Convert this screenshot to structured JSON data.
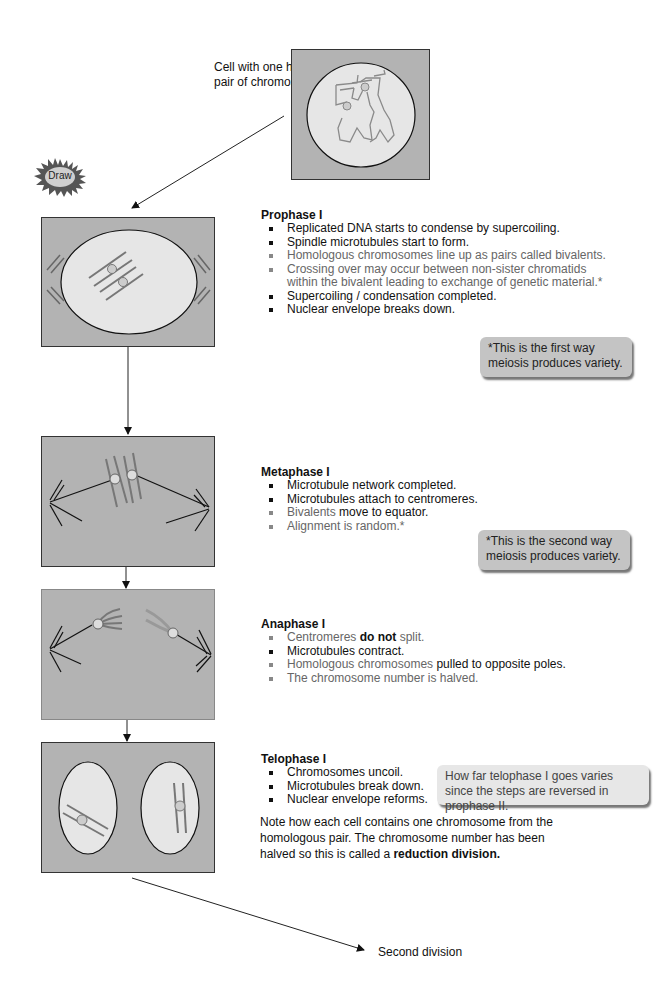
{
  "intro": {
    "label_line1": "Cell with one homologous",
    "label_line2": "pair of chromosomes"
  },
  "draw_badge": {
    "label": "Draw"
  },
  "stages": [
    {
      "title": "Prophase I",
      "bullets": [
        {
          "text": "Replicated DNA starts to condense by supercoiling.",
          "tone": "dark"
        },
        {
          "text": "Spindle microtubules start to form.",
          "tone": "dark"
        },
        {
          "text": "Homologous chromosomes line up as pairs called bivalents.",
          "tone": "grey"
        },
        {
          "text": "Crossing over may occur between non-sister chromatids within the bivalent leading to exchange of genetic material.*",
          "tone": "grey"
        },
        {
          "text": "Supercoiling / condensation completed.",
          "tone": "dark"
        },
        {
          "text": "Nuclear envelope breaks down.",
          "tone": "dark"
        }
      ],
      "callout": "*This is the first way meiosis produces variety."
    },
    {
      "title": "Metaphase I",
      "bullets": [
        {
          "text": "Microtubule network completed.",
          "tone": "dark"
        },
        {
          "text": "Microtubules attach to centromeres.",
          "tone": "dark"
        },
        {
          "parts": [
            "Bivalents",
            " move to equator."
          ],
          "tone": "mixed"
        },
        {
          "text": "Alignment is random.*",
          "tone": "grey"
        }
      ],
      "callout": "*This is the second way meiosis produces variety."
    },
    {
      "title": "Anaphase I",
      "bullets": [
        {
          "parts": [
            "Centromeres ",
            "do not",
            " split."
          ],
          "tone": "mixed"
        },
        {
          "text": "Microtubules contract.",
          "tone": "dark"
        },
        {
          "parts": [
            "Homologous chromosomes",
            " pulled to opposite poles."
          ],
          "tone": "mixed"
        },
        {
          "text": "The chromosome number is halved.",
          "tone": "grey"
        }
      ]
    },
    {
      "title": "Telophase I",
      "bullets": [
        {
          "text": "Chromosomes uncoil.",
          "tone": "dark"
        },
        {
          "text": "Microtubules break down.",
          "tone": "dark"
        },
        {
          "text": "Nuclear envelope reforms.",
          "tone": "dark"
        }
      ],
      "callout": "How far telophase I goes varies since the steps are reversed in prophase II.",
      "note_prefix": "Note how each cell contains one chromosome from the homologous pair. The chromosome number has been halved so this is called a ",
      "note_bold": "reduction division."
    }
  ],
  "next": {
    "label": "Second division"
  },
  "colors": {
    "cell_bg": "#b3b3b3",
    "nucleus_fill": "#e6e6e6",
    "chromosome": "#7a7a7a",
    "callout_dark": "#c4c4c4",
    "callout_light": "#e7e7e7"
  }
}
